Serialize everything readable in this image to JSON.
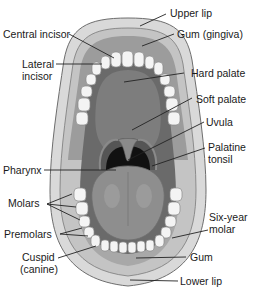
{
  "diagram": {
    "style": "grayscale medical illustration",
    "colors": {
      "background": "#ffffff",
      "lip": "#d8d8d8",
      "lip_outline": "#6e6e6e",
      "gum": "#9a9a9a",
      "palate": "#6f6f6f",
      "throat": "#111111",
      "tongue": "#8c8c8c",
      "teeth": "#f4f4f4",
      "leader_line": "#222222",
      "text": "#1a1a1a"
    },
    "labels": {
      "upper_lip": "Upper lip",
      "gum_gingiva": "Gum (gingiva)",
      "central_incisor": "Central incisor",
      "lateral_incisor_1": "Lateral",
      "lateral_incisor_2": "incisor",
      "hard_palate": "Hard palate",
      "soft_palate": "Soft palate",
      "uvula": "Uvula",
      "pharynx": "Pharynx",
      "palatine_tonsil_1": "Palatine",
      "palatine_tonsil_2": "tonsil",
      "molars": "Molars",
      "six_year_molar_1": "Six-year",
      "six_year_molar_2": "molar",
      "premolars": "Premolars",
      "cuspid_1": "Cuspid",
      "cuspid_2": "(canine)",
      "gum": "Gum",
      "lower_lip": "Lower lip"
    }
  }
}
